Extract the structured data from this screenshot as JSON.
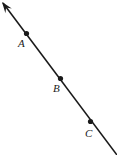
{
  "figure": {
    "canvas": {
      "width": 117,
      "height": 155
    },
    "background_color": "#ffffff",
    "stroke_color": "#1a1a1a",
    "stroke_width": 1.6,
    "line": {
      "name": "ray-ABC",
      "arrow_end": {
        "x": 3,
        "y": 3
      },
      "tail_end": {
        "x": 117,
        "y": 155
      },
      "has_arrowhead_at_start": true,
      "has_arrowhead_at_end": false
    },
    "arrowhead": {
      "name": "arrowhead-up-left",
      "tip": {
        "x": 2,
        "y": 2
      },
      "size": 11
    },
    "points": [
      {
        "id": "A",
        "label": "A",
        "dot": {
          "x": 26.5,
          "y": 33.5
        },
        "dot_radius": 2.6,
        "label_pos": {
          "x": 18,
          "y": 38
        }
      },
      {
        "id": "B",
        "label": "B",
        "dot": {
          "x": 60.5,
          "y": 78.5
        },
        "dot_radius": 2.6,
        "label_pos": {
          "x": 53,
          "y": 83
        }
      },
      {
        "id": "C",
        "label": "C",
        "dot": {
          "x": 90.5,
          "y": 121.5
        },
        "dot_radius": 2.6,
        "label_pos": {
          "x": 85,
          "y": 128
        }
      }
    ]
  }
}
